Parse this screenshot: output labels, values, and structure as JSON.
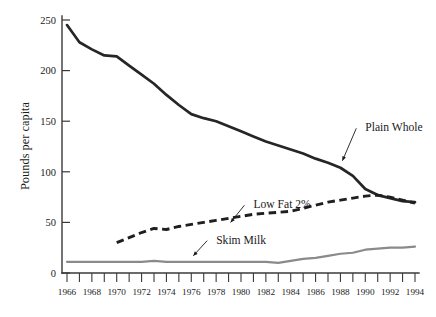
{
  "chart_data": {
    "type": "line",
    "title": "",
    "subtitle": "",
    "xlabel": "",
    "ylabel": "Pounds per capita",
    "xlim": [
      1966,
      1994
    ],
    "ylim": [
      0,
      250
    ],
    "grid": false,
    "legend_position": "inline-annotations",
    "y_ticks": [
      0,
      50,
      100,
      150,
      200,
      250
    ],
    "y_tick_labels": [
      "0",
      "50",
      "100",
      "150",
      "200",
      "250"
    ],
    "x_ticks": [
      1966,
      1967,
      1968,
      1969,
      1970,
      1971,
      1972,
      1973,
      1974,
      1975,
      1976,
      1977,
      1978,
      1979,
      1980,
      1981,
      1982,
      1983,
      1984,
      1985,
      1986,
      1987,
      1988,
      1989,
      1990,
      1991,
      1992,
      1993,
      1994
    ],
    "x_tick_labels": [
      "1966",
      "1968",
      "1970",
      "1972",
      "1974",
      "1976",
      "1978",
      "1980",
      "1982",
      "1984",
      "1986",
      "1988",
      "1990",
      "1992",
      "1994"
    ],
    "x_labeled_ticks": [
      1966,
      1968,
      1970,
      1972,
      1974,
      1976,
      1978,
      1980,
      1982,
      1984,
      1986,
      1988,
      1990,
      1992,
      1994
    ],
    "series": [
      {
        "name": "Plain Whole",
        "style": "solid",
        "color": "#262626",
        "x": [
          1966,
          1967,
          1968,
          1969,
          1970,
          1971,
          1972,
          1973,
          1974,
          1975,
          1976,
          1977,
          1978,
          1979,
          1980,
          1981,
          1982,
          1983,
          1984,
          1985,
          1986,
          1987,
          1988,
          1989,
          1990,
          1991,
          1992,
          1993,
          1994
        ],
        "values": [
          245,
          228,
          221,
          215,
          214,
          205,
          196,
          187,
          176,
          166,
          157,
          153,
          150,
          145,
          140,
          135,
          130,
          126,
          122,
          118,
          113,
          109,
          104,
          96,
          83,
          77,
          74,
          71,
          70
        ]
      },
      {
        "name": "Low Fat 2%",
        "style": "dashed",
        "color": "#1f1f1f",
        "x": [
          1970,
          1971,
          1972,
          1973,
          1974,
          1975,
          1976,
          1977,
          1978,
          1979,
          1980,
          1981,
          1982,
          1983,
          1984,
          1985,
          1986,
          1987,
          1988,
          1989,
          1990,
          1991,
          1992,
          1993,
          1994
        ],
        "values": [
          30,
          35,
          40,
          44,
          43,
          46,
          48,
          50,
          52,
          54,
          56,
          58,
          59,
          60,
          61,
          64,
          67,
          70,
          72,
          74,
          76,
          77,
          75,
          72,
          69
        ]
      },
      {
        "name": "Skim Milk",
        "style": "solid",
        "color": "#8a8a8a",
        "x": [
          1966,
          1967,
          1968,
          1969,
          1970,
          1971,
          1972,
          1973,
          1974,
          1975,
          1976,
          1977,
          1978,
          1979,
          1980,
          1981,
          1982,
          1983,
          1984,
          1985,
          1986,
          1987,
          1988,
          1989,
          1990,
          1991,
          1992,
          1993,
          1994
        ],
        "values": [
          11,
          11,
          11,
          11,
          11,
          11,
          11,
          12,
          11,
          11,
          11,
          11,
          11,
          11,
          11,
          11,
          11,
          10,
          12,
          14,
          15,
          17,
          19,
          20,
          23,
          24,
          25,
          25,
          26
        ]
      }
    ],
    "annotations": [
      {
        "label": "Plain Whole",
        "text_x": 1990,
        "text_y": 140,
        "target_x": 1988,
        "target_y": 108
      },
      {
        "label": "Low Fat 2%",
        "text_x": 1981,
        "text_y": 64,
        "target_x": 1979,
        "target_y": 47
      },
      {
        "label": "Skim Milk",
        "text_x": 1978,
        "text_y": 29,
        "target_x": 1976,
        "target_y": 14
      }
    ]
  },
  "axis": {
    "y_title": "Pounds per capita"
  }
}
